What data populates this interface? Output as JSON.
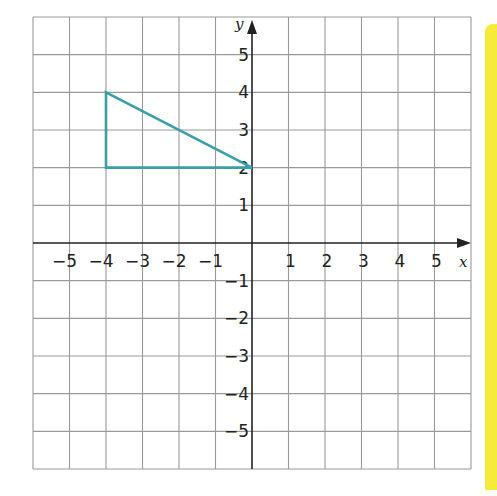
{
  "chart_data": {
    "type": "scatter",
    "title": "",
    "xlabel": "x",
    "ylabel": "y",
    "xlim": [
      -6,
      6
    ],
    "ylim": [
      -6,
      6
    ],
    "grid": true,
    "x_ticks": [
      -5,
      -4,
      -3,
      -2,
      -1,
      1,
      2,
      3,
      4,
      5
    ],
    "y_ticks": [
      5,
      4,
      3,
      2,
      1,
      -1,
      -2,
      -3,
      -4,
      -5
    ],
    "x_tick_labels": [
      "−5",
      "−4",
      "−3",
      "−2",
      "−1",
      "1",
      "2",
      "3",
      "4",
      "5"
    ],
    "y_tick_labels": [
      "5",
      "4",
      "3",
      "2",
      "1",
      "−1",
      "−2",
      "−3",
      "−4",
      "−5"
    ],
    "shapes": [
      {
        "name": "triangle",
        "type": "polygon",
        "vertices": [
          [
            -4,
            4
          ],
          [
            -4,
            2
          ],
          [
            0,
            2
          ]
        ],
        "color": "#3a9fa8"
      }
    ]
  },
  "colors": {
    "grid": "#9a9a9a",
    "axis": "#222222",
    "shape": "#3a9fa8",
    "margin_strip": "#f5ec3a"
  }
}
